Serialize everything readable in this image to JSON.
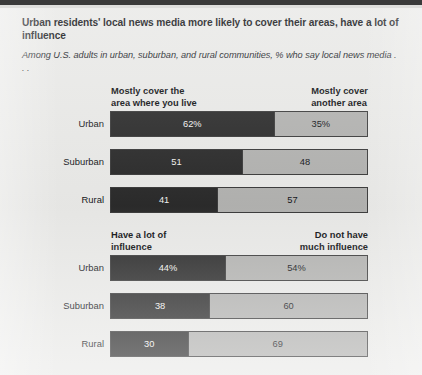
{
  "figure": {
    "title": "Urban residents' local news media more likely to cover their areas, have a lot of  influence",
    "subtitle": "Among U.S. adults in urban, suburban, and rural communities, % who say local news media . . .",
    "colors": {
      "dark_segment": "#2b2b2b",
      "light_segment": "#b2b2b0",
      "background": "#e9e9e7",
      "border": "#3b3b3b"
    }
  },
  "chart_data": [
    {
      "type": "bar",
      "title": "Mostly cover the area where you live / Mostly cover another area",
      "orientation": "horizontal",
      "stacked": true,
      "categories": [
        "Urban",
        "Suburban",
        "Rural"
      ],
      "headers": {
        "left": "Mostly cover the\narea where you live",
        "right": "Mostly cover\nanother area"
      },
      "series": [
        {
          "name": "Mostly cover the area where you live",
          "values": [
            62,
            51,
            41
          ],
          "labels": [
            "62%",
            "51",
            "41"
          ]
        },
        {
          "name": "Mostly cover another area",
          "values": [
            35,
            48,
            57
          ],
          "labels": [
            "35%",
            "48",
            "57"
          ]
        }
      ],
      "xlabel": "",
      "ylabel": "",
      "grid": false,
      "legend": "column-headers"
    },
    {
      "type": "bar",
      "title": "Have a lot of influence / Do not have much influence",
      "orientation": "horizontal",
      "stacked": true,
      "categories": [
        "Urban",
        "Suburban",
        "Rural"
      ],
      "headers": {
        "left": "Have a lot of\ninfluence",
        "right": "Do not have\nmuch influence"
      },
      "series": [
        {
          "name": "Have a lot of influence",
          "values": [
            44,
            38,
            30
          ],
          "labels": [
            "44%",
            "38",
            "30"
          ]
        },
        {
          "name": "Do not have much influence",
          "values": [
            54,
            60,
            69
          ],
          "labels": [
            "54%",
            "60",
            "69"
          ]
        }
      ],
      "xlabel": "",
      "ylabel": "",
      "grid": false,
      "legend": "column-headers"
    }
  ],
  "footer": {
    "source": ""
  }
}
